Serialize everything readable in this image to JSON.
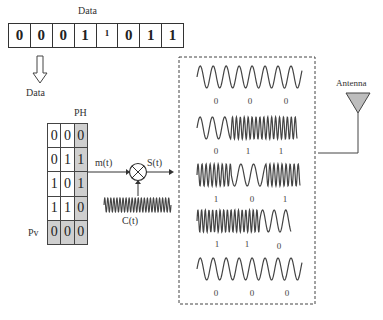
{
  "top_data": {
    "label": "Data",
    "bits": [
      "0",
      "0",
      "0",
      "1",
      "1",
      "0",
      "1",
      "1"
    ],
    "small_bit_index": 4
  },
  "arrow_label": "Data",
  "parity_matrix": {
    "ph_label": "PH",
    "pv_label": "Pv",
    "rows": [
      [
        "0",
        "0",
        "0"
      ],
      [
        "0",
        "1",
        "1"
      ],
      [
        "1",
        "0",
        "1"
      ],
      [
        "1",
        "1",
        "0"
      ],
      [
        "0",
        "0",
        "0"
      ]
    ],
    "shade_color": "#cfcfcf"
  },
  "modulator": {
    "input_label": "m(t)",
    "output_label": "S(t)",
    "carrier_label": "C(t)"
  },
  "waveforms": [
    {
      "bits": [
        "0",
        "0",
        "0"
      ]
    },
    {
      "bits": [
        "0",
        "1",
        "1"
      ]
    },
    {
      "bits": [
        "1",
        "0",
        "1"
      ]
    },
    {
      "bits": [
        "1",
        "1",
        "0"
      ]
    },
    {
      "bits": [
        "0",
        "0",
        "0"
      ]
    }
  ],
  "antenna": {
    "label": "Antenna",
    "fill_color": "#bdbdbd"
  }
}
